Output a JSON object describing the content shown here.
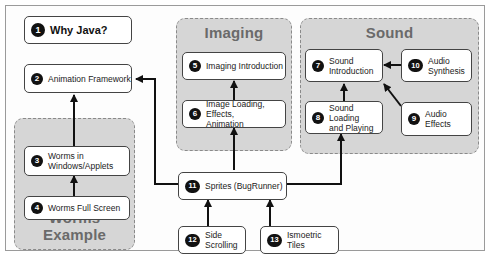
{
  "groups": {
    "imaging": {
      "title": "Imaging"
    },
    "sound": {
      "title": "Sound"
    },
    "worms": {
      "title": "Worms Example"
    }
  },
  "nodes": [
    {
      "num": "1",
      "label": "Why Java?"
    },
    {
      "num": "2",
      "label": "Animation Framework"
    },
    {
      "num": "3",
      "label": "Worms in\nWindows/Applets"
    },
    {
      "num": "4",
      "label": "Worms Full Screen"
    },
    {
      "num": "5",
      "label": "Imaging Introduction"
    },
    {
      "num": "6",
      "label": "Image Loading, Effects,\nAnimation"
    },
    {
      "num": "7",
      "label": "Sound\nIntroduction"
    },
    {
      "num": "8",
      "label": "Sound Loading\nand Playing"
    },
    {
      "num": "9",
      "label": "Audio\nEffects"
    },
    {
      "num": "10",
      "label": "Audio\nSynthesis"
    },
    {
      "num": "11",
      "label": "Sprites (BugRunner)"
    },
    {
      "num": "12",
      "label": "Side Scrolling"
    },
    {
      "num": "13",
      "label": "Ismoetric Tiles"
    }
  ],
  "edges": [
    {
      "from": "4",
      "to": "3"
    },
    {
      "from": "3",
      "to": "2"
    },
    {
      "from": "11",
      "to": "2"
    },
    {
      "from": "6",
      "to": "5"
    },
    {
      "from": "11",
      "to": "6"
    },
    {
      "from": "8",
      "to": "7"
    },
    {
      "from": "10",
      "to": "7"
    },
    {
      "from": "9",
      "to": "7"
    },
    {
      "from": "11",
      "to": "8"
    },
    {
      "from": "12",
      "to": "11"
    },
    {
      "from": "13",
      "to": "11"
    }
  ],
  "colors": {
    "group_fill": "#d6d6d6",
    "group_title": "#6a6a6a",
    "node_fill": "#ffffff",
    "badge": "#111111",
    "arrow": "#111111"
  }
}
